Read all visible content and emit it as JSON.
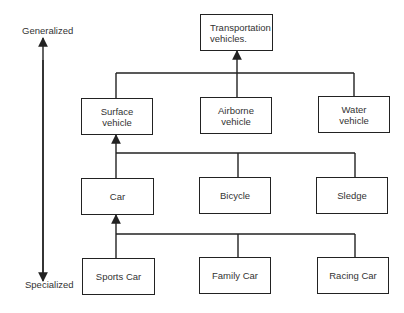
{
  "diagram": {
    "type": "generalization-hierarchy",
    "axis": {
      "top_label": "Generalized",
      "bottom_label": "Specialized"
    },
    "root": {
      "label": "Transportation\nvehicles."
    },
    "level1": [
      {
        "label": "Surface\nvehicle"
      },
      {
        "label": "Airborne\nvehicle"
      },
      {
        "label": "Water\nvehicle"
      }
    ],
    "level2": [
      {
        "label": "Car"
      },
      {
        "label": "Bicycle"
      },
      {
        "label": "Sledge"
      }
    ],
    "level3": [
      {
        "label": "Sports Car"
      },
      {
        "label": "Family Car"
      },
      {
        "label": "Racing Car"
      }
    ],
    "relations": [
      {
        "from": "level1",
        "to": "Transportation vehicles."
      },
      {
        "from": "level2",
        "to": "Surface vehicle"
      },
      {
        "from": "level3",
        "to": "Car"
      }
    ],
    "colors": {
      "line": "#222222",
      "text": "#333333",
      "background": "#ffffff"
    }
  }
}
